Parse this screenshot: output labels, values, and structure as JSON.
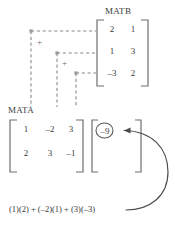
{
  "diagram": {
    "title_matb": "MATB",
    "title_mata": "MATA",
    "equation": "(1)(2) + (–2)(1) + (3)(–3)",
    "plus_sign": "+",
    "colors": {
      "text": "#3a3a3a",
      "dashed": "#8a8a8a",
      "bracket": "#6e6e6e",
      "arrow": "#4a4a4a",
      "circle": "#5a5a5a",
      "background": "#ffffff"
    },
    "matb": {
      "label": "MATB",
      "rows": 3,
      "cols": 2,
      "values": [
        [
          "2",
          "1"
        ],
        [
          "1",
          "3"
        ],
        [
          "–3",
          "2"
        ]
      ]
    },
    "mata": {
      "label": "MATA",
      "rows": 2,
      "cols": 3,
      "values": [
        [
          "1",
          "–2",
          "3"
        ],
        [
          "2",
          "3",
          "–1"
        ]
      ]
    },
    "result": {
      "highlighted_value": "–9",
      "rows": 1,
      "cols": 1
    },
    "connectors": [
      {
        "from_column": 1,
        "to_row": 1,
        "plus_after": "+"
      },
      {
        "from_column": 2,
        "to_row": 2,
        "plus_after": "+"
      },
      {
        "from_column": 3,
        "to_row": 3,
        "plus_after": ""
      }
    ]
  }
}
